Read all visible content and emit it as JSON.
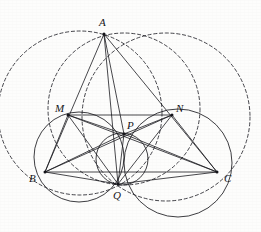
{
  "figure": {
    "kind": "geometry-diagram",
    "width": 261,
    "height": 232,
    "background_color": "#fdfdfc",
    "solid_stroke_color": "#1b1b20",
    "dashed_stroke_color": "#23232a",
    "label_color": "#15151a"
  },
  "points": [
    {
      "id": "A",
      "label": "A",
      "x": 104,
      "y": 34,
      "label_x": 99,
      "label_y": 17
    },
    {
      "id": "M",
      "label": "M",
      "x": 68,
      "y": 115,
      "label_x": 55,
      "label_y": 103
    },
    {
      "id": "N",
      "label": "N",
      "x": 172,
      "y": 115,
      "label_x": 176,
      "label_y": 103
    },
    {
      "id": "P",
      "label": "P",
      "x": 124,
      "y": 134,
      "label_x": 127,
      "label_y": 120
    },
    {
      "id": "B",
      "label": "B",
      "x": 45,
      "y": 172,
      "label_x": 29,
      "label_y": 173
    },
    {
      "id": "C",
      "label": "C",
      "x": 217,
      "y": 172,
      "label_x": 224,
      "label_y": 173
    },
    {
      "id": "Q",
      "label": "Q",
      "x": 118,
      "y": 184,
      "label_x": 113,
      "label_y": 190
    }
  ],
  "segments": [
    {
      "name": "segment-AB",
      "from": "A",
      "to": "B"
    },
    {
      "name": "segment-AC",
      "from": "A",
      "to": "C"
    },
    {
      "name": "segment-BC",
      "from": "B",
      "to": "C"
    },
    {
      "name": "segment-AP",
      "from": "A",
      "to": "P"
    },
    {
      "name": "segment-AQ",
      "from": "A",
      "to": "Q"
    },
    {
      "name": "segment-MN",
      "from": "M",
      "to": "N"
    },
    {
      "name": "segment-MB",
      "from": "M",
      "to": "B"
    },
    {
      "name": "segment-MC",
      "from": "M",
      "to": "C"
    },
    {
      "name": "segment-MQ",
      "from": "M",
      "to": "Q"
    },
    {
      "name": "segment-MP",
      "from": "M",
      "to": "P"
    },
    {
      "name": "segment-NB",
      "from": "N",
      "to": "B"
    },
    {
      "name": "segment-NC",
      "from": "N",
      "to": "C"
    },
    {
      "name": "segment-NQ",
      "from": "N",
      "to": "Q"
    },
    {
      "name": "segment-NP",
      "from": "N",
      "to": "P"
    },
    {
      "name": "segment-BP",
      "from": "B",
      "to": "P"
    },
    {
      "name": "segment-CP",
      "from": "C",
      "to": "P"
    },
    {
      "name": "segment-PQ",
      "from": "P",
      "to": "Q"
    },
    {
      "name": "segment-BQ",
      "from": "B",
      "to": "Q"
    },
    {
      "name": "segment-CQ",
      "from": "C",
      "to": "Q"
    }
  ],
  "circles_solid": [
    {
      "name": "circle-MBQ",
      "cx": 79,
      "cy": 157,
      "r": 45,
      "through": "M, B, Q"
    },
    {
      "name": "circle-NCQ",
      "cx": 178,
      "cy": 163,
      "r": 54,
      "through": "N, C, Q"
    },
    {
      "name": "circle-PQ",
      "cx": 122,
      "cy": 159,
      "r": 26,
      "through": "P, Q"
    }
  ],
  "circles_dashed": [
    {
      "name": "circumcircle-ABQ",
      "cx": 80,
      "cy": 113,
      "r": 82,
      "through": "A, B, Q"
    },
    {
      "name": "circumcircle-ACQ",
      "cx": 166,
      "cy": 117,
      "r": 84,
      "through": "A, C, Q"
    },
    {
      "name": "circumcircle-AMNQ",
      "cx": 124,
      "cy": 109,
      "r": 76,
      "through": "A, M, N, Q"
    }
  ]
}
